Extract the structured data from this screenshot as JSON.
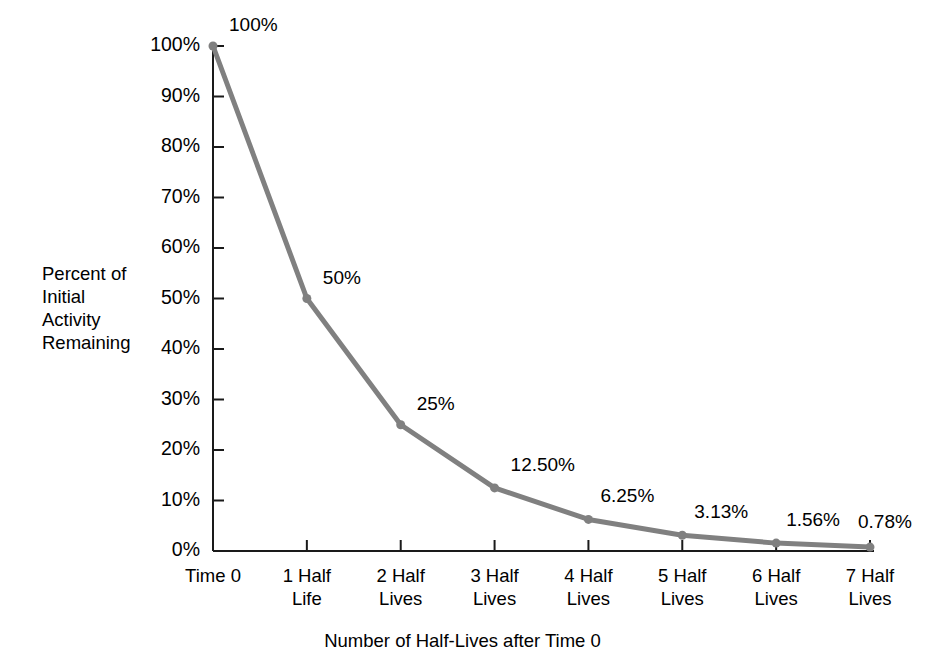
{
  "chart_data": {
    "type": "line",
    "title": "",
    "xlabel": "Number of Half-Lives after Time 0",
    "ylabel": "Percent of\nInitial\nActivity\nRemaining",
    "categories": [
      "Time 0",
      "1 Half\nLife",
      "2 Half\nLives",
      "3 Half\nLives",
      "4 Half\nLives",
      "5 Half\nLives",
      "6 Half\nLives",
      "7 Half\nLives"
    ],
    "values": [
      100,
      50,
      25,
      12.5,
      6.25,
      3.13,
      1.56,
      0.78
    ],
    "point_labels": [
      "100%",
      "50%",
      "25%",
      "12.50%",
      "6.25%",
      "3.13%",
      "1.56%",
      "0.78%"
    ],
    "ylim": [
      0,
      100
    ],
    "y_tick_labels": [
      "100%",
      "90%",
      "80%",
      "70%",
      "60%",
      "50%",
      "40%",
      "30%",
      "20%",
      "10%",
      "0%"
    ],
    "y_tick_values": [
      100,
      90,
      80,
      70,
      60,
      50,
      40,
      30,
      20,
      10,
      0
    ],
    "grid": false,
    "legend": false,
    "series_color": "#808080",
    "axis_color": "#1a1a1a",
    "background": "#ffffff"
  }
}
